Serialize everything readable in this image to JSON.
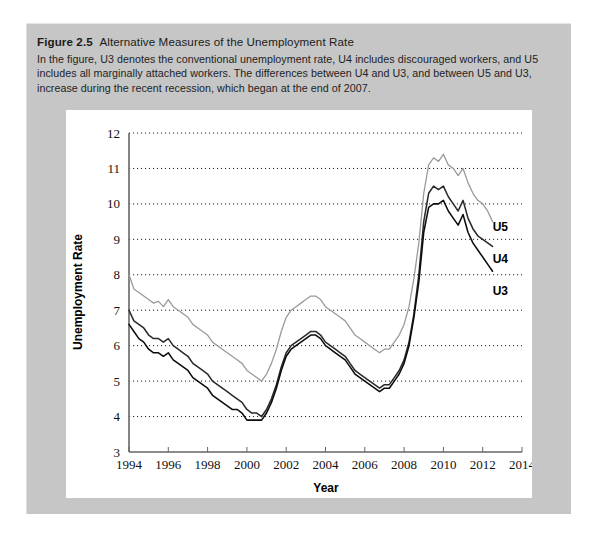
{
  "figure": {
    "label": "Figure 2.5",
    "title": "Alternative Measures of the Unemployment Rate",
    "description": "In the figure, U3 denotes the conventional unemployment rate, U4 includes discouraged workers, and U5 includes all marginally attached workers. The differences between U4 and U3, and between U5 and U3, increase during the recent recession, which began at the end of 2007."
  },
  "colors": {
    "panel_background": "#c6c6c6",
    "plot_background": "#ffffff",
    "u3_line": "#0d0d0d",
    "u4_line": "#2b2b2b",
    "u5_line": "#9a9a9a",
    "gridline": "#1a1a1a",
    "axis": "#555555"
  },
  "chart_data": {
    "type": "line",
    "title": "Alternative Measures of the Unemployment Rate",
    "xlabel": "Year",
    "ylabel": "Unemployment Rate",
    "xlim": [
      1994,
      2014
    ],
    "ylim": [
      3,
      12
    ],
    "xticks": [
      1994,
      1996,
      1998,
      2000,
      2002,
      2004,
      2006,
      2008,
      2010,
      2012,
      2014
    ],
    "yticks": [
      3,
      4,
      5,
      6,
      7,
      8,
      9,
      10,
      11,
      12
    ],
    "grid": "horizontal-dotted",
    "legend_position": "right-inline-annotations",
    "annotations": [
      {
        "text": "U5",
        "x": 2012.9,
        "y": 9.35
      },
      {
        "text": "U4",
        "x": 2012.9,
        "y": 8.45
      },
      {
        "text": "U3",
        "x": 2012.9,
        "y": 7.55
      }
    ],
    "x": [
      1994.0,
      1994.25,
      1994.5,
      1994.75,
      1995.0,
      1995.25,
      1995.5,
      1995.75,
      1996.0,
      1996.25,
      1996.5,
      1996.75,
      1997.0,
      1997.25,
      1997.5,
      1997.75,
      1998.0,
      1998.25,
      1998.5,
      1998.75,
      1999.0,
      1999.25,
      1999.5,
      1999.75,
      2000.0,
      2000.25,
      2000.5,
      2000.75,
      2001.0,
      2001.25,
      2001.5,
      2001.75,
      2002.0,
      2002.25,
      2002.5,
      2002.75,
      2003.0,
      2003.25,
      2003.5,
      2003.75,
      2004.0,
      2004.25,
      2004.5,
      2004.75,
      2005.0,
      2005.25,
      2005.5,
      2005.75,
      2006.0,
      2006.25,
      2006.5,
      2006.75,
      2007.0,
      2007.25,
      2007.5,
      2007.75,
      2008.0,
      2008.25,
      2008.5,
      2008.75,
      2009.0,
      2009.25,
      2009.5,
      2009.75,
      2010.0,
      2010.25,
      2010.5,
      2010.75,
      2011.0,
      2011.25,
      2011.5,
      2011.75,
      2012.0,
      2012.25,
      2012.5
    ],
    "series": [
      {
        "name": "U5",
        "color": "#9a9a9a",
        "values": [
          8.0,
          7.6,
          7.5,
          7.4,
          7.3,
          7.2,
          7.25,
          7.1,
          7.3,
          7.1,
          7.0,
          6.9,
          6.8,
          6.6,
          6.5,
          6.4,
          6.3,
          6.1,
          6.0,
          5.9,
          5.8,
          5.7,
          5.6,
          5.5,
          5.3,
          5.2,
          5.1,
          5.0,
          5.2,
          5.5,
          5.9,
          6.4,
          6.8,
          7.0,
          7.1,
          7.2,
          7.3,
          7.4,
          7.4,
          7.3,
          7.1,
          7.0,
          6.9,
          6.8,
          6.7,
          6.5,
          6.3,
          6.2,
          6.1,
          6.0,
          5.9,
          5.8,
          5.9,
          5.9,
          6.1,
          6.3,
          6.6,
          7.1,
          7.9,
          8.9,
          10.3,
          11.1,
          11.3,
          11.2,
          11.4,
          11.1,
          11.0,
          10.8,
          11.0,
          10.6,
          10.3,
          10.1,
          10.0,
          9.8,
          9.5
        ]
      },
      {
        "name": "U4",
        "color": "#2b2b2b",
        "values": [
          7.0,
          6.7,
          6.6,
          6.5,
          6.3,
          6.2,
          6.2,
          6.1,
          6.2,
          6.0,
          5.9,
          5.8,
          5.7,
          5.5,
          5.4,
          5.3,
          5.2,
          5.0,
          4.9,
          4.8,
          4.7,
          4.6,
          4.5,
          4.4,
          4.2,
          4.1,
          4.1,
          4.0,
          4.2,
          4.5,
          4.9,
          5.4,
          5.8,
          6.0,
          6.1,
          6.2,
          6.3,
          6.4,
          6.4,
          6.3,
          6.1,
          6.0,
          5.9,
          5.8,
          5.7,
          5.5,
          5.3,
          5.2,
          5.1,
          5.0,
          4.9,
          4.8,
          4.9,
          4.9,
          5.1,
          5.3,
          5.6,
          6.1,
          6.9,
          8.0,
          9.5,
          10.3,
          10.5,
          10.4,
          10.5,
          10.2,
          10.0,
          9.8,
          10.1,
          9.6,
          9.3,
          9.1,
          9.0,
          8.9,
          8.8
        ]
      },
      {
        "name": "U3",
        "color": "#0d0d0d",
        "values": [
          6.6,
          6.4,
          6.2,
          6.1,
          5.9,
          5.8,
          5.8,
          5.7,
          5.8,
          5.6,
          5.5,
          5.4,
          5.3,
          5.1,
          5.0,
          4.9,
          4.8,
          4.6,
          4.5,
          4.4,
          4.3,
          4.2,
          4.2,
          4.1,
          3.9,
          3.9,
          3.9,
          3.9,
          4.1,
          4.4,
          4.8,
          5.3,
          5.7,
          5.9,
          6.0,
          6.1,
          6.2,
          6.3,
          6.3,
          6.2,
          6.0,
          5.9,
          5.8,
          5.7,
          5.6,
          5.4,
          5.2,
          5.1,
          5.0,
          4.9,
          4.8,
          4.7,
          4.8,
          4.8,
          5.0,
          5.2,
          5.5,
          6.0,
          6.8,
          7.8,
          9.2,
          9.9,
          10.0,
          10.0,
          10.1,
          9.8,
          9.6,
          9.4,
          9.7,
          9.2,
          8.9,
          8.7,
          8.5,
          8.3,
          8.1
        ]
      }
    ]
  }
}
